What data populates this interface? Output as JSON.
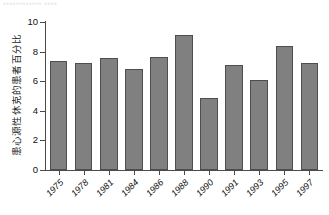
{
  "clipped_header": {
    "text": "▪▪▪▪▪▪▪▪▪▪▪▪   ▪▪▪▪"
  },
  "chart_data": {
    "type": "bar",
    "title": "",
    "subtitle": "",
    "xlabel": "",
    "ylabel": "患心源性休克的患者百分比",
    "categories": [
      "1975",
      "1978",
      "1981",
      "1984",
      "1986",
      "1988",
      "1990",
      "1991",
      "1993",
      "1995",
      "1997"
    ],
    "values": [
      7.35,
      7.2,
      7.55,
      6.8,
      7.65,
      9.15,
      4.85,
      7.1,
      6.05,
      8.4,
      7.25
    ],
    "series": [
      {
        "name": "患心源性休克的患者百分比",
        "values": [
          7.35,
          7.2,
          7.55,
          6.8,
          7.65,
          9.15,
          4.85,
          7.1,
          6.05,
          8.4,
          7.25
        ]
      }
    ],
    "ylim": [
      0,
      10
    ],
    "ytick_labels": [
      "0",
      "2",
      "4",
      "6",
      "8",
      "10"
    ],
    "ytick_values": [
      0,
      2,
      4,
      6,
      8,
      10
    ],
    "grid": false,
    "legend": false,
    "legend_position": "none",
    "bar_color": "#808080",
    "bar_edge_color": "#4e4e4e",
    "axis_color": "#4a4a4a",
    "background_color": "#ffffff",
    "xtick_rotation": -45
  }
}
